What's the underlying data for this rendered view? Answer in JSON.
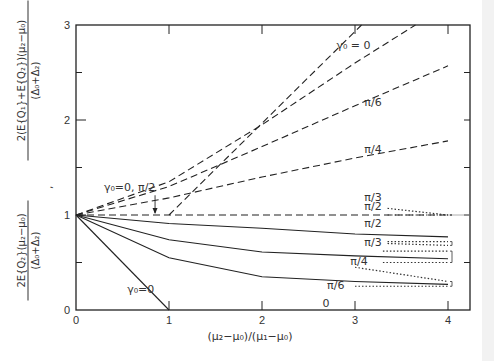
{
  "chart_data": {
    "type": "line",
    "title": "",
    "xlabel": "(μ₂−μ₀)/(μ₁−μ₀)",
    "ylabel_upper": {
      "numerator": "2(E{Q₁}+E{Q₂})(μ₂−μ₀)",
      "denominator": "(Δ₀+Δ₂)"
    },
    "ylabel_lower": {
      "numerator": "2E{Q₂}(μ₂−μ₀)",
      "denominator": "(Δ₀+Δ₂)"
    },
    "ylabel_separator": ",",
    "xlim": [
      0,
      4.2
    ],
    "ylim": [
      0,
      3
    ],
    "xticks": [
      "0",
      "1",
      "2",
      "3",
      "4"
    ],
    "yticks": [
      "0",
      "1",
      "2",
      "3"
    ],
    "grid": false,
    "series": [
      {
        "name": "γ₀=0 (upper, dashed)",
        "style": "dashed",
        "x": [
          1,
          3.07
        ],
        "y": [
          1.0,
          3.0
        ]
      },
      {
        "name": "π/6 (upper, dashed)",
        "style": "dashed",
        "x": [
          0,
          1,
          2,
          3,
          3.65
        ],
        "y": [
          1.0,
          1.35,
          1.95,
          2.6,
          3.0
        ]
      },
      {
        "name": "π/4 (upper, dashed)",
        "style": "dashed",
        "x": [
          0,
          1,
          2,
          3,
          4
        ],
        "y": [
          1.0,
          1.3,
          1.72,
          2.15,
          2.57
        ]
      },
      {
        "name": "π/3 (upper, dashed)",
        "style": "dashed",
        "x": [
          0,
          1,
          2,
          3,
          4
        ],
        "y": [
          1.0,
          1.18,
          1.4,
          1.6,
          1.78
        ]
      },
      {
        "name": "γ₀=0, π/2 (dashed)",
        "style": "dashed",
        "x": [
          0,
          4
        ],
        "y": [
          1.0,
          1.0
        ]
      },
      {
        "name": "π/2 (lower, solid)",
        "style": "solid",
        "x": [
          0,
          1,
          2,
          3,
          4
        ],
        "y": [
          1.0,
          0.91,
          0.86,
          0.8,
          0.77
        ]
      },
      {
        "name": "π/3 / π/4 (lower, solid)",
        "style": "solid",
        "x": [
          0,
          1,
          2,
          3,
          4
        ],
        "y": [
          1.0,
          0.74,
          0.61,
          0.57,
          0.54
        ]
      },
      {
        "name": "π/6 (lower, solid)",
        "style": "solid",
        "x": [
          0,
          1,
          2,
          3,
          4
        ],
        "y": [
          1.0,
          0.55,
          0.35,
          0.3,
          0.27
        ]
      },
      {
        "name": "γ₀=0 (lower, solid)",
        "style": "solid",
        "x": [
          0,
          1
        ],
        "y": [
          1.0,
          0.0
        ]
      }
    ],
    "dotted_bounds": [
      {
        "label": "π/2",
        "x": [
          3.35,
          4
        ],
        "y_upper": [
          1.07,
          1.0
        ],
        "y_lower": [
          1.0,
          1.0
        ]
      },
      {
        "label": "π/3",
        "x": [
          3.35,
          4
        ],
        "y_upper": [
          0.72,
          0.72
        ],
        "y_lower": [
          0.7,
          0.68
        ]
      },
      {
        "label": "π/4",
        "x": [
          3.3,
          4
        ],
        "y_upper": [
          0.62,
          0.62
        ],
        "y_lower": [
          0.5,
          0.5
        ]
      },
      {
        "label": "π/6",
        "x": [
          3.0,
          4
        ],
        "y_upper": [
          0.45,
          0.3
        ],
        "y_lower": [
          0.25,
          0.25
        ]
      }
    ],
    "annotations": [
      {
        "text": "γ₀ = 0",
        "x": 2.8,
        "y": 2.75
      },
      {
        "text": "π/6",
        "x": 3.1,
        "y": 2.15
      },
      {
        "text": "π/4",
        "x": 3.1,
        "y": 1.65
      },
      {
        "text": "π/3",
        "x": 3.1,
        "y": 1.15
      },
      {
        "text": "π/2",
        "x": 3.1,
        "y": 1.05
      },
      {
        "text": "π/2",
        "x": 3.1,
        "y": 0.87
      },
      {
        "text": "π/3",
        "x": 3.1,
        "y": 0.67
      },
      {
        "text": "π/4",
        "x": 2.95,
        "y": 0.47
      },
      {
        "text": "π/6",
        "x": 2.7,
        "y": 0.22
      },
      {
        "text": "γ₀=0, π/2",
        "x": 0.3,
        "y": 1.25
      },
      {
        "text": "γ₀=0",
        "x": 0.55,
        "y": 0.18
      },
      {
        "text": "0",
        "x": 2.65,
        "y": 0.03
      }
    ]
  }
}
